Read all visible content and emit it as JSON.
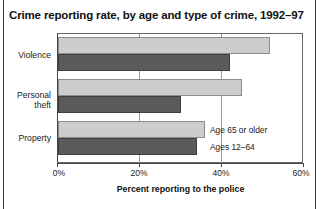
{
  "chart_data": {
    "type": "bar",
    "orientation": "horizontal",
    "title": "Crime reporting rate, by age and type of crime, 1992–97",
    "xlabel": "Percent reporting to the police",
    "ylabel": "",
    "xlim": [
      0,
      60
    ],
    "xticks": [
      0,
      20,
      40,
      60
    ],
    "xticklabels": [
      "0%",
      "20%",
      "40%",
      "60%"
    ],
    "grid": true,
    "legend_position": "inline-right-of-property-bars",
    "categories": [
      "Violence",
      "Personal theft",
      "Property"
    ],
    "series": [
      {
        "name": "Age 65 or older",
        "color": "#cdcdcd",
        "values": [
          52,
          45,
          36
        ]
      },
      {
        "name": "Ages 12–64",
        "color": "#5b5b5b",
        "values": [
          42,
          30,
          34
        ]
      }
    ]
  },
  "figure": {
    "title": "Crime reporting rate, by age and type of crime, 1992–97",
    "axis": {
      "x_title": "Percent reporting to the police",
      "ticks": [
        {
          "value": 0,
          "label": "0%"
        },
        {
          "value": 20,
          "label": "20%"
        },
        {
          "value": 40,
          "label": "40%"
        },
        {
          "value": 60,
          "label": "60%"
        }
      ]
    },
    "categories": [
      {
        "label": "Violence"
      },
      {
        "label": "Personal\ntheft"
      },
      {
        "label": "Property"
      }
    ],
    "legend": [
      {
        "label": "Age 65 or older",
        "swatch": "#cdcdcd"
      },
      {
        "label": "Ages 12–64",
        "swatch": "#5b5b5b"
      }
    ],
    "bars": [
      {
        "category": "Violence",
        "series": "Age 65 or older",
        "value": 52
      },
      {
        "category": "Violence",
        "series": "Ages 12–64",
        "value": 42
      },
      {
        "category": "Personal theft",
        "series": "Age 65 or older",
        "value": 45
      },
      {
        "category": "Personal theft",
        "series": "Ages 12–64",
        "value": 30
      },
      {
        "category": "Property",
        "series": "Age 65 or older",
        "value": 36
      },
      {
        "category": "Property",
        "series": "Ages 12–64",
        "value": 34
      }
    ]
  }
}
